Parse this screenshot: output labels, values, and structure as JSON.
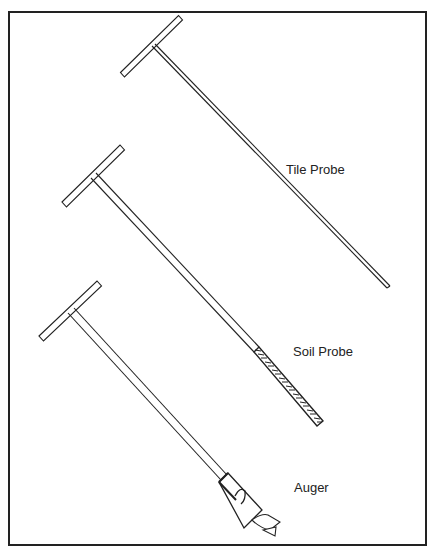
{
  "diagram": {
    "type": "illustration",
    "stroke_color": "#222222",
    "background_color": "#ffffff",
    "tools": [
      {
        "id": "tile-probe",
        "label": "Tile Probe"
      },
      {
        "id": "soil-probe",
        "label": "Soil Probe"
      },
      {
        "id": "auger",
        "label": "Auger"
      }
    ]
  }
}
